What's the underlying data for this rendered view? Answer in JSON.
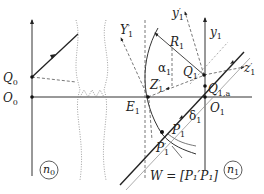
{
  "diagram": {
    "type": "optics-geometry",
    "labels": {
      "Q0": "Q",
      "Q0_sub": "0",
      "O0": "O",
      "O0_sub": "0",
      "Y1p": "Y",
      "Y1p_sub": "1",
      "Y1p_prime": "′",
      "y1p": "y",
      "y1p_sub": "1",
      "y1p_prime": "′",
      "y1": "y",
      "y1_sub": "1",
      "R1": "R",
      "R1_sub": "1",
      "alpha1": "α",
      "alpha1_sub": "1",
      "Z1p": "Z",
      "Z1p_sub": "1",
      "Z1p_prime": "′",
      "Q1": "Q",
      "Q1_sub": "1",
      "z1p": "z",
      "z1p_sub": "1",
      "z1p_prime": "′",
      "Q1a": "Q",
      "Q1a_sub": "1,a",
      "E1": "E",
      "E1_sub": "1",
      "O1": "O",
      "O1_sub": "1",
      "delta1": "δ",
      "delta1_sub": "1",
      "P1": "P",
      "P1_sub": "1",
      "P1p": "P",
      "P1p_sub": "1",
      "P1p_prime": "′",
      "W_formula": "W = [P₁′P₁]",
      "n0": "n",
      "n0_sub": "0",
      "n1": "n",
      "n1_sub": "1"
    },
    "colors": {
      "line": "#333333",
      "dashed": "#555555",
      "dotted": "#888888"
    }
  }
}
